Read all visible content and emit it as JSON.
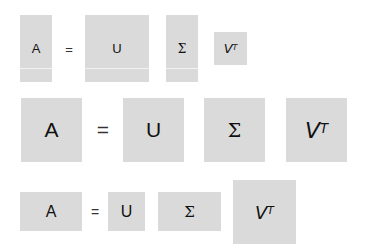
{
  "rows": [
    {
      "label": "row-1-tall-matrices",
      "A": "A",
      "equals": "=",
      "U": "U",
      "Sigma": "Σ",
      "V": "V",
      "T": "T"
    },
    {
      "label": "row-2-square-matrices",
      "A": "A",
      "equals": "=",
      "U": "U",
      "Sigma": "Σ",
      "V": "V",
      "T": "T"
    },
    {
      "label": "row-3-wide-matrices",
      "A": "A",
      "equals": "=",
      "U": "U",
      "Sigma": "Σ",
      "V": "V",
      "T": "T"
    }
  ],
  "colors": {
    "matrix_fill": "#dadada",
    "text": "#111111",
    "background": "#ffffff"
  }
}
